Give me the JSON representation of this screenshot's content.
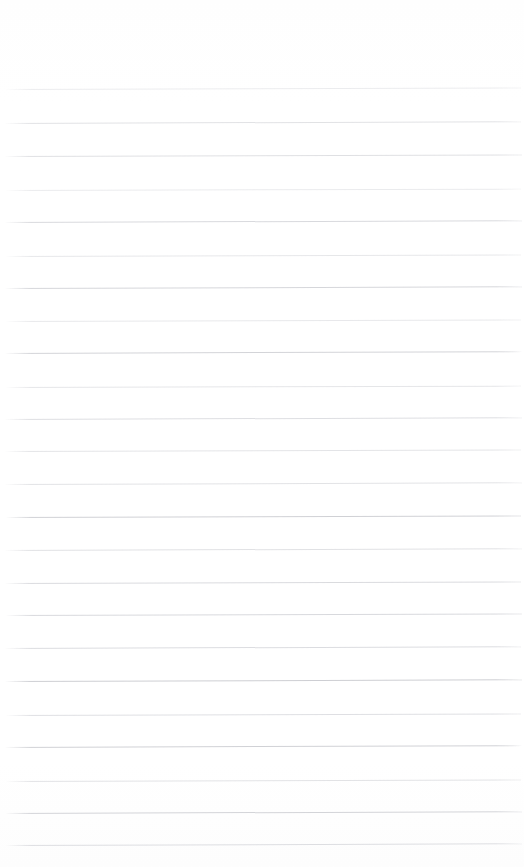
{
  "document": {
    "kind": "lined-paper",
    "title": "Blank ruled notebook page",
    "content_text": "",
    "page_width": 524,
    "page_height": 867,
    "background_color": "#ffffff",
    "rule_color": "#d9dade",
    "rule_thickness_px": 1,
    "rule_spacing_px": 33,
    "first_rule_y": 89,
    "last_rule_y": 844,
    "rule_count": 23,
    "left_margin_px": 6,
    "right_edge_px": 520,
    "has_vertical_margin_rule": false,
    "has_text": false,
    "has_handwriting": false
  },
  "ruled_lines": [
    {
      "index": 1,
      "y": 89,
      "x_start": 6,
      "x_end": 521,
      "tilt_deg": -0.16,
      "opacity": 0.55,
      "color": "#dcdde1"
    },
    {
      "index": 2,
      "y": 123,
      "x_start": 5,
      "x_end": 521,
      "tilt_deg": -0.2,
      "opacity": 0.7,
      "color": "#d5d6da"
    },
    {
      "index": 3,
      "y": 156,
      "x_start": 5,
      "x_end": 522,
      "tilt_deg": -0.18,
      "opacity": 0.72,
      "color": "#d4d5d9"
    },
    {
      "index": 4,
      "y": 190,
      "x_start": 6,
      "x_end": 521,
      "tilt_deg": -0.15,
      "opacity": 0.58,
      "color": "#dcdde1"
    },
    {
      "index": 5,
      "y": 222,
      "x_start": 5,
      "x_end": 522,
      "tilt_deg": -0.2,
      "opacity": 0.8,
      "color": "#cfd0d5"
    },
    {
      "index": 6,
      "y": 256,
      "x_start": 6,
      "x_end": 521,
      "tilt_deg": -0.17,
      "opacity": 0.62,
      "color": "#d8d9dd"
    },
    {
      "index": 7,
      "y": 288,
      "x_start": 5,
      "x_end": 522,
      "tilt_deg": -0.19,
      "opacity": 0.82,
      "color": "#cdced3"
    },
    {
      "index": 8,
      "y": 321,
      "x_start": 6,
      "x_end": 521,
      "tilt_deg": -0.16,
      "opacity": 0.6,
      "color": "#d9dade"
    },
    {
      "index": 9,
      "y": 353,
      "x_start": 5,
      "x_end": 522,
      "tilt_deg": -0.21,
      "opacity": 0.84,
      "color": "#cbccd1"
    },
    {
      "index": 10,
      "y": 387,
      "x_start": 6,
      "x_end": 521,
      "tilt_deg": -0.15,
      "opacity": 0.64,
      "color": "#d7d8dc"
    },
    {
      "index": 11,
      "y": 419,
      "x_start": 5,
      "x_end": 522,
      "tilt_deg": -0.2,
      "opacity": 0.74,
      "color": "#d2d3d8"
    },
    {
      "index": 12,
      "y": 451,
      "x_start": 5,
      "x_end": 521,
      "tilt_deg": -0.18,
      "opacity": 0.66,
      "color": "#d6d7db"
    },
    {
      "index": 13,
      "y": 484,
      "x_start": 5,
      "x_end": 522,
      "tilt_deg": -0.19,
      "opacity": 0.68,
      "color": "#d5d6da"
    },
    {
      "index": 14,
      "y": 517,
      "x_start": 6,
      "x_end": 521,
      "tilt_deg": -0.17,
      "opacity": 0.86,
      "color": "#c9cacf"
    },
    {
      "index": 15,
      "y": 550,
      "x_start": 5,
      "x_end": 522,
      "tilt_deg": -0.2,
      "opacity": 0.7,
      "color": "#d4d5d9"
    },
    {
      "index": 16,
      "y": 583,
      "x_start": 5,
      "x_end": 521,
      "tilt_deg": -0.18,
      "opacity": 0.78,
      "color": "#d0d1d6"
    },
    {
      "index": 17,
      "y": 615,
      "x_start": 6,
      "x_end": 522,
      "tilt_deg": -0.16,
      "opacity": 0.8,
      "color": "#cfd0d5"
    },
    {
      "index": 18,
      "y": 648,
      "x_start": 5,
      "x_end": 521,
      "tilt_deg": -0.2,
      "opacity": 0.76,
      "color": "#d1d2d7"
    },
    {
      "index": 19,
      "y": 681,
      "x_start": 5,
      "x_end": 522,
      "tilt_deg": -0.19,
      "opacity": 0.88,
      "color": "#c7c8cd"
    },
    {
      "index": 20,
      "y": 715,
      "x_start": 6,
      "x_end": 521,
      "tilt_deg": -0.17,
      "opacity": 0.72,
      "color": "#d3d4d9"
    },
    {
      "index": 21,
      "y": 747,
      "x_start": 5,
      "x_end": 522,
      "tilt_deg": -0.21,
      "opacity": 0.86,
      "color": "#c9cacf"
    },
    {
      "index": 22,
      "y": 781,
      "x_start": 6,
      "x_end": 521,
      "tilt_deg": -0.16,
      "opacity": 0.68,
      "color": "#d5d6da"
    },
    {
      "index": 23,
      "y": 813,
      "x_start": 5,
      "x_end": 522,
      "tilt_deg": -0.2,
      "opacity": 0.84,
      "color": "#cbccd1"
    },
    {
      "index": 24,
      "y": 845,
      "x_start": 5,
      "x_end": 522,
      "tilt_deg": -0.19,
      "opacity": 0.74,
      "color": "#d2d3d8"
    }
  ]
}
